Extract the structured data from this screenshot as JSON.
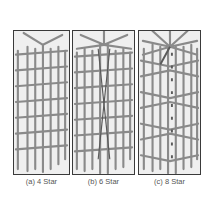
{
  "figure": {
    "panels": [
      {
        "id": "a",
        "caption": "(a) 4 Star",
        "star_count": 4
      },
      {
        "id": "b",
        "caption": "(b) 6 Star",
        "star_count": 6
      },
      {
        "id": "c",
        "caption": "(c) 8 Star",
        "star_count": 8
      }
    ],
    "colors": {
      "bar": "#8a8a8a",
      "bar_dark": "#5a5a5a",
      "frame": "#3a3a3a",
      "panel_bg": "#efefef"
    }
  }
}
